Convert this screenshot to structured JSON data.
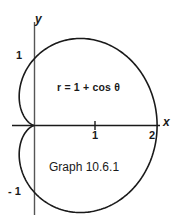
{
  "figure": {
    "caption": "Graph 10.6.1",
    "equation": "r = 1 + cos θ",
    "background_color": "#ffffff",
    "ink_color": "#1a1a1a"
  },
  "axes": {
    "x_name": "x",
    "y_name": "y",
    "x_ticks": [
      {
        "label": "1",
        "value": 1
      },
      {
        "label": "2",
        "value": 2
      }
    ],
    "y_ticks": [
      {
        "label": "1",
        "value": 1
      },
      {
        "label": "- 1",
        "value": -1
      }
    ]
  },
  "chart_data": {
    "type": "line",
    "title": "Graph 10.6.1",
    "annotations": [
      "r = 1 + cos θ",
      "Graph 10.6.1"
    ],
    "curve_name": "cardioid",
    "polar_equation": "r = 1 + cos(theta)",
    "xlabel": "x",
    "ylabel": "y",
    "xlim": [
      -0.4,
      2.3
    ],
    "ylim": [
      -1.45,
      1.45
    ],
    "grid": false,
    "legend": "none",
    "key_points": [
      {
        "theta_deg": 0,
        "r": 2,
        "x": 2,
        "y": 0
      },
      {
        "theta_deg": 90,
        "r": 1,
        "x": 0,
        "y": 1
      },
      {
        "theta_deg": 180,
        "r": 0,
        "x": 0,
        "y": 0
      },
      {
        "theta_deg": 270,
        "r": 1,
        "x": 0,
        "y": -1
      }
    ],
    "x": [
      2,
      1.982,
      1.928,
      1.84,
      1.723,
      1.582,
      1.424,
      1.256,
      1.085,
      0.919,
      0.763,
      0.622,
      0.5,
      0.399,
      0.319,
      0.259,
      0.216,
      0.186,
      0.166,
      0.153,
      0.144,
      0.135,
      0.125,
      0.111,
      0.092,
      0.068,
      0.042,
      0.018,
      0.004,
      0
    ],
    "y": [
      0,
      0.342,
      0.661,
      0.938,
      1.156,
      1.305,
      1.376,
      1.369,
      1.294,
      1.163,
      0.992,
      0.799,
      0.598,
      0.404,
      0.232,
      0.09,
      -0.02,
      -0.1,
      -0.155,
      -0.19,
      -0.21,
      -0.218,
      -0.217,
      -0.208,
      -0.191,
      -0.165,
      -0.129,
      -0.083,
      -0.03,
      0
    ]
  }
}
